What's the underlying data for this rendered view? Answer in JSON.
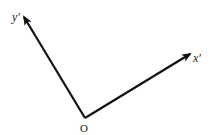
{
  "diagram": {
    "type": "rotated coordinate axes",
    "origin": {
      "label": "O",
      "x": 85,
      "y": 118
    },
    "axes": [
      {
        "name": "x-prime-axis",
        "label": "x′",
        "tip": {
          "x": 191,
          "y": 53
        }
      },
      {
        "name": "y-prime-axis",
        "label": "y′",
        "tip": {
          "x": 23,
          "y": 16
        }
      }
    ],
    "colors": {
      "line": "#111111",
      "text": "#222222",
      "background": "#ffffff"
    }
  }
}
